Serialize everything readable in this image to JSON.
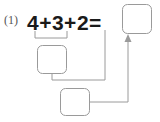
{
  "page": {
    "background_color": "#ffffff",
    "width": 160,
    "height": 122
  },
  "problem": {
    "number_label": "(1)",
    "expression": "4+3+2=",
    "terms": [
      "4",
      "3",
      "2"
    ],
    "operators": [
      "+",
      "+"
    ],
    "equals": "=",
    "answer_box_value": "",
    "step1_box_value": "",
    "step2_box_value": "",
    "text_color": "#1a1a1a",
    "number_label_color": "#555555"
  },
  "diagram": {
    "stroke_color": "#9a9a9a",
    "stroke_width": 1,
    "boxes": [
      {
        "name": "answer-box",
        "label": "",
        "x": 122,
        "y": 4,
        "w": 30,
        "h": 30,
        "rx": 5
      },
      {
        "name": "step1-box",
        "label": "",
        "x": 37,
        "y": 45,
        "w": 30,
        "h": 29,
        "rx": 5
      },
      {
        "name": "step2-box",
        "label": "",
        "x": 60,
        "y": 88,
        "w": 30,
        "h": 28,
        "rx": 5
      }
    ],
    "brace": {
      "name": "grouping-brace-4-plus-3",
      "left_x": 35,
      "right_x": 67,
      "top_y": 31,
      "bottom_y": 38
    },
    "connectors": [
      {
        "name": "step1-to-term2-connector",
        "path": "M 52 74 L 52 80 L 105 80 L 105 30"
      },
      {
        "name": "step2-to-answer-connector",
        "path": "M 90 102 L 128 102 L 128 40"
      }
    ],
    "arrowhead": {
      "name": "answer-arrowhead",
      "tip_x": 128,
      "tip_y": 35,
      "width": 7,
      "height": 8
    }
  }
}
